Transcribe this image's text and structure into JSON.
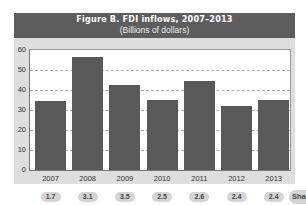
{
  "header": {
    "title": "Figure B. FDI inflows, 2007–2013",
    "subtitle": "(Billions of dollars)"
  },
  "colors": {
    "header_bg": "#5d5d5d",
    "panel_bg": "#dedede",
    "bar": "#595959",
    "pill_bg": "#d4d4d4"
  },
  "y_ticks": [
    "0",
    "10",
    "20",
    "30",
    "40",
    "50",
    "60"
  ],
  "x_ticks": [
    "2007",
    "2008",
    "2009",
    "2010",
    "2011",
    "2012",
    "2013"
  ],
  "pills": [
    "1.7",
    "3.1",
    "3.5",
    "2.5",
    "2.6",
    "2.4",
    "2.4"
  ],
  "share_label": "Shar",
  "chart_data": {
    "type": "bar",
    "title": "Figure B. FDI inflows, 2007–2013",
    "subtitle": "(Billions of dollars)",
    "categories": [
      "2007",
      "2008",
      "2009",
      "2010",
      "2011",
      "2012",
      "2013"
    ],
    "values": [
      34.5,
      56.5,
      42.4,
      34.8,
      44.5,
      32.2,
      35.1
    ],
    "xlabel": "",
    "ylabel": "Billions of dollars",
    "ylim": [
      0,
      60
    ],
    "yticks": [
      0,
      10,
      20,
      30,
      40,
      50,
      60
    ],
    "grid": true,
    "grid_style": "dashed horizontal at 10,20,30,40,50",
    "legend": null,
    "annotations": {
      "share_row_label": "Shar(e)",
      "share_values": [
        "1.7",
        "3.1",
        "3.5",
        "2.5",
        "2.6",
        "2.4",
        "2.4"
      ]
    }
  }
}
